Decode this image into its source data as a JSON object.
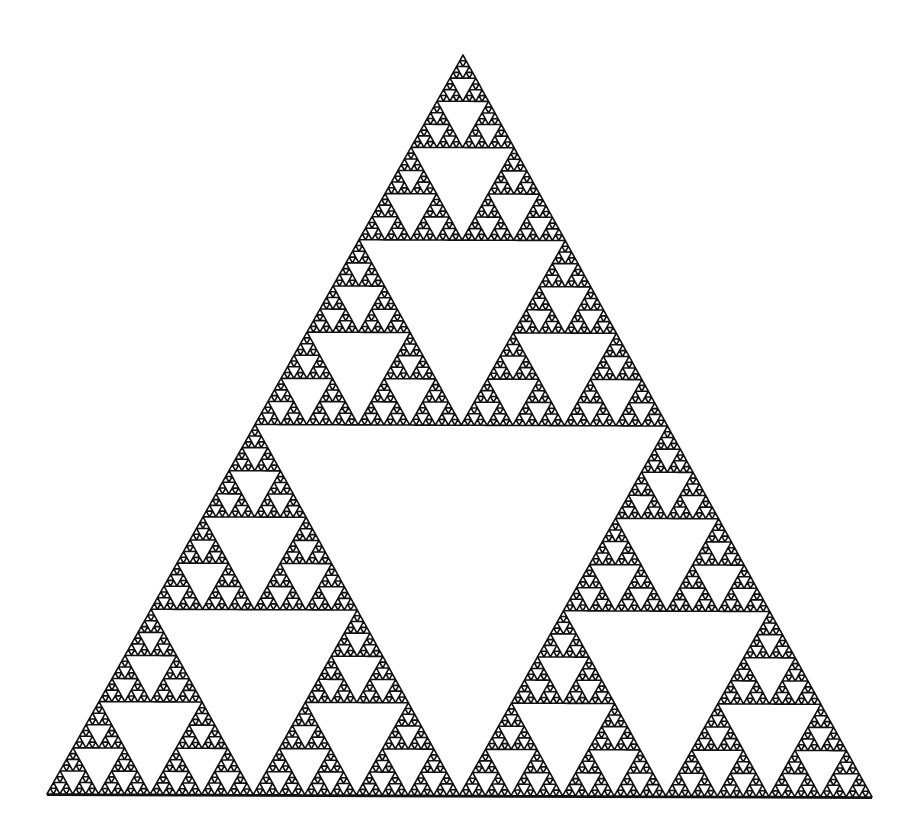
{
  "figure": {
    "background": "#ffffff",
    "ink": "#111111",
    "depth": 7,
    "vertices": {
      "apex": [
        463,
        55
      ],
      "bottom_left": [
        47,
        794
      ],
      "bottom_right": [
        872,
        797
      ]
    },
    "stroke_width": 1.6
  }
}
